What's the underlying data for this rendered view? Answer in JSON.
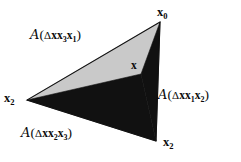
{
  "figure": {
    "type": "geometric-diagram",
    "width": 241,
    "height": 162,
    "background_color": "#ffffff",
    "colors": {
      "fill_dark": "#111111",
      "fill_light_gray": "#c9c9c9",
      "text": "#0a0a0a",
      "outline": "#111111"
    },
    "vertices": [
      {
        "id": "x0",
        "label_base": "x",
        "label_sub": "0",
        "cx": 160,
        "cy": 22,
        "label_x": 157,
        "label_y": 6
      },
      {
        "id": "x2_left",
        "label_base": "x",
        "label_sub": "2",
        "cx": 27,
        "cy": 100,
        "label_x": 4,
        "label_y": 92
      },
      {
        "id": "x2_bottom",
        "label_base": "x",
        "label_sub": "2",
        "cx": 156,
        "cy": 141,
        "label_x": 163,
        "label_y": 136
      }
    ],
    "interior_point": {
      "id": "x",
      "label_base": "x",
      "cx": 141,
      "cy": 74,
      "label_x": 131,
      "label_y": 60
    },
    "regions": [
      {
        "id": "region-x3x1",
        "fill": "#c9c9c9",
        "points": "160,22 27,100 141,74",
        "label": {
          "script": "A",
          "open": "(",
          "delta": "Δ",
          "terms": [
            {
              "base": "x",
              "sub": ""
            },
            {
              "base": "x",
              "sub": "3"
            },
            {
              "base": "x",
              "sub": "1"
            }
          ],
          "close": ")"
        }
      },
      {
        "id": "region-x1x2",
        "fill": "#111111",
        "points": "160,22 141,74 156,141",
        "label": {
          "script": "A",
          "open": "(",
          "delta": "Δ",
          "terms": [
            {
              "base": "x",
              "sub": ""
            },
            {
              "base": "x",
              "sub": "1"
            },
            {
              "base": "x",
              "sub": "2"
            }
          ],
          "close": ")"
        }
      },
      {
        "id": "region-x2x3",
        "fill": "#111111",
        "points": "27,100 141,74 156,141",
        "label": {
          "script": "A",
          "open": "(",
          "delta": "Δ",
          "terms": [
            {
              "base": "x",
              "sub": ""
            },
            {
              "base": "x",
              "sub": "2"
            },
            {
              "base": "x",
              "sub": "3"
            }
          ],
          "close": ")"
        }
      }
    ],
    "labels": {
      "x0": {
        "base": "x",
        "sub": "0"
      },
      "x2_left": {
        "base": "x",
        "sub": "2"
      },
      "x2_bottom": {
        "base": "x",
        "sub": "2"
      },
      "x_interior": {
        "base": "x",
        "sub": ""
      },
      "script_a": "A",
      "delta": "Δ",
      "paren_open": "(",
      "paren_close": ")"
    }
  }
}
